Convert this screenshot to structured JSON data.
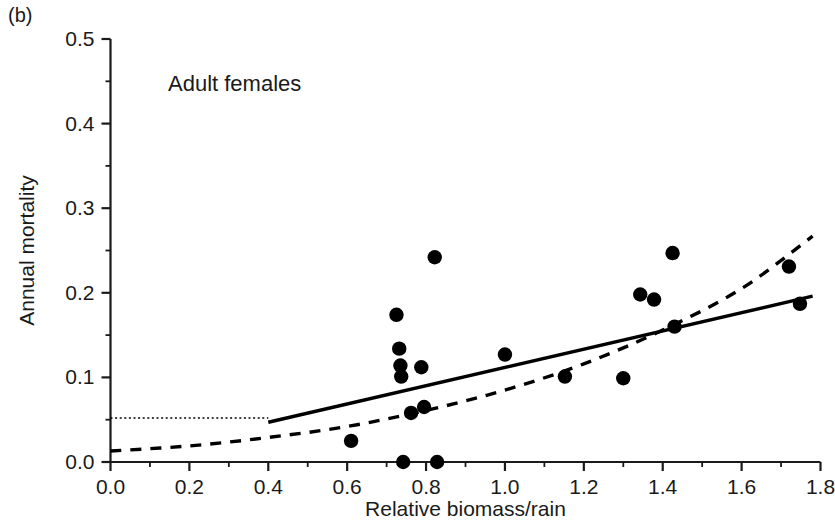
{
  "panel": {
    "label": "(b)",
    "annotation": "Adult females"
  },
  "chart_data": {
    "type": "scatter",
    "title": "",
    "subtitle": "Adult females",
    "xlabel": "Relative biomass/rain",
    "ylabel": "Annual mortality",
    "xlim": [
      0.0,
      1.8
    ],
    "ylim": [
      0.0,
      0.5
    ],
    "grid": false,
    "legend": "none",
    "x_ticks": [
      "0.0",
      "0.2",
      "0.4",
      "0.6",
      "0.8",
      "1.0",
      "1.2",
      "1.4",
      "1.6",
      "1.8"
    ],
    "x_tick_values": [
      0.0,
      0.2,
      0.4,
      0.6,
      0.8,
      1.0,
      1.2,
      1.4,
      1.6,
      1.8
    ],
    "x_minor_step": 0.1,
    "y_ticks": [
      "0.0",
      "0.1",
      "0.2",
      "0.3",
      "0.4",
      "0.5"
    ],
    "y_tick_values": [
      0.0,
      0.1,
      0.2,
      0.3,
      0.4,
      0.5
    ],
    "y_minor_step": 0.05,
    "points": [
      {
        "x": 0.61,
        "y": 0.025
      },
      {
        "x": 0.725,
        "y": 0.174
      },
      {
        "x": 0.732,
        "y": 0.134
      },
      {
        "x": 0.735,
        "y": 0.114
      },
      {
        "x": 0.737,
        "y": 0.101
      },
      {
        "x": 0.742,
        "y": 0.0
      },
      {
        "x": 0.762,
        "y": 0.058
      },
      {
        "x": 0.788,
        "y": 0.112
      },
      {
        "x": 0.795,
        "y": 0.065
      },
      {
        "x": 0.822,
        "y": 0.242
      },
      {
        "x": 0.828,
        "y": 0.0
      },
      {
        "x": 1.0,
        "y": 0.127
      },
      {
        "x": 1.152,
        "y": 0.101
      },
      {
        "x": 1.3,
        "y": 0.099
      },
      {
        "x": 1.343,
        "y": 0.198
      },
      {
        "x": 1.378,
        "y": 0.192
      },
      {
        "x": 1.425,
        "y": 0.247
      },
      {
        "x": 1.43,
        "y": 0.16
      },
      {
        "x": 1.72,
        "y": 0.231
      },
      {
        "x": 1.748,
        "y": 0.187
      }
    ],
    "series": [
      {
        "name": "linear-threshold-fit",
        "style": "solid",
        "description": "Flat dotted segment at constant mortality up to the breakpoint, then a rising solid line",
        "threshold_level": 0.052,
        "breakpoint_x": 0.4,
        "line": [
          {
            "x": 0.4,
            "y": 0.047
          },
          {
            "x": 1.78,
            "y": 0.196
          }
        ],
        "flat_segment": [
          {
            "x": 0.0,
            "y": 0.052
          },
          {
            "x": 0.4,
            "y": 0.052
          }
        ]
      },
      {
        "name": "curvilinear-fit",
        "style": "dashed",
        "description": "Upward-curving dashed regression across the full x range",
        "curve": [
          {
            "x": 0.0,
            "y": 0.013
          },
          {
            "x": 0.2,
            "y": 0.019
          },
          {
            "x": 0.4,
            "y": 0.029
          },
          {
            "x": 0.6,
            "y": 0.042
          },
          {
            "x": 0.8,
            "y": 0.061
          },
          {
            "x": 1.0,
            "y": 0.085
          },
          {
            "x": 1.2,
            "y": 0.116
          },
          {
            "x": 1.4,
            "y": 0.156
          },
          {
            "x": 1.6,
            "y": 0.205
          },
          {
            "x": 1.78,
            "y": 0.267
          }
        ]
      }
    ]
  }
}
